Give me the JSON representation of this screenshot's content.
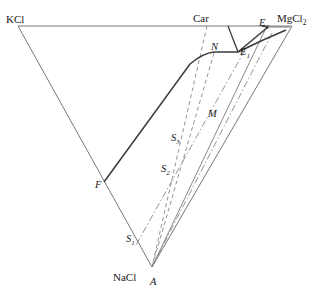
{
  "figure": {
    "kind": "ternary-phase-diagram",
    "background_color": "#ffffff",
    "line_color": "#555555",
    "bold_line_color": "#3a3a3a",
    "text_color": "#1a1a1a",
    "width": 319,
    "height": 296
  },
  "vertices": [
    {
      "id": "kcl",
      "label": "KCl",
      "sub": "",
      "x": 18,
      "y": 26,
      "label_x": 6,
      "label_y": 14
    },
    {
      "id": "mgcl2",
      "label": "MgCl",
      "sub": "2",
      "x": 292,
      "y": 26,
      "label_x": 277,
      "label_y": 13
    },
    {
      "id": "nacl",
      "label": "NaCl",
      "sub": "",
      "x": 152,
      "y": 267,
      "label_x": 113,
      "label_y": 272
    }
  ],
  "points": [
    {
      "id": "car",
      "label": "Car",
      "sub": "",
      "italic": false,
      "x": 207,
      "y": 25,
      "label_x": 193,
      "label_y": 13
    },
    {
      "id": "e2",
      "label": "E",
      "sub": "2",
      "italic": true,
      "x": 268,
      "y": 27,
      "label_x": 259,
      "label_y": 18
    },
    {
      "id": "e1",
      "label": "E",
      "sub": "1",
      "italic": true,
      "x": 238,
      "y": 52,
      "label_x": 240,
      "label_y": 47
    },
    {
      "id": "n",
      "label": "N",
      "sub": "",
      "italic": true,
      "x": 214,
      "y": 52,
      "label_x": 211,
      "label_y": 42
    },
    {
      "id": "m",
      "label": "M",
      "sub": "",
      "italic": true,
      "x": 204,
      "y": 114,
      "label_x": 208,
      "label_y": 109
    },
    {
      "id": "s3",
      "label": "S",
      "sub": "3",
      "italic": true,
      "x": 185,
      "y": 140,
      "label_x": 171,
      "label_y": 133
    },
    {
      "id": "s2",
      "label": "S",
      "sub": "2",
      "italic": true,
      "x": 175,
      "y": 172,
      "label_x": 161,
      "label_y": 164
    },
    {
      "id": "s1",
      "label": "S",
      "sub": "1",
      "italic": true,
      "x": 139,
      "y": 240,
      "label_x": 126,
      "label_y": 234
    },
    {
      "id": "f",
      "label": "F",
      "sub": "",
      "italic": true,
      "x": 104,
      "y": 182,
      "label_x": 95,
      "label_y": 180
    },
    {
      "id": "a",
      "label": "A",
      "sub": "",
      "italic": true,
      "x": 152,
      "y": 267,
      "label_x": 150,
      "label_y": 277
    }
  ],
  "edges": {
    "triangle_top": {
      "from": "kcl",
      "to": "mgcl2",
      "style": "solid-thin"
    },
    "triangle_left": {
      "from": "kcl",
      "to": "nacl",
      "style": "solid-thin"
    },
    "triangle_right": {
      "from": "mgcl2",
      "to": "nacl",
      "style": "solid-thin"
    }
  },
  "boundary_curves": [
    {
      "id": "f-n-e1",
      "desc": "solid boundary F to N to E1",
      "style": "solid-bold"
    },
    {
      "id": "e1-e2",
      "desc": "solid boundary E1 to E2",
      "style": "solid-bold"
    },
    {
      "id": "e2-top",
      "desc": "solid boundary E2 up to top edge",
      "style": "solid-bold"
    },
    {
      "id": "e1-mgcl2",
      "desc": "solid boundary E1 toward MgCl2 corner",
      "style": "solid-bold"
    }
  ],
  "dashed_lines": [
    {
      "id": "car-a",
      "desc": "dashed line Car to A",
      "style": "dashed"
    },
    {
      "id": "n-a",
      "desc": "dashed line N through M to A",
      "style": "dashed"
    }
  ],
  "dashdot_lines": [
    {
      "id": "e1-s1",
      "desc": "dash-dot from E1 through M to S1",
      "style": "dashdot"
    },
    {
      "id": "mgcl2-a",
      "desc": "dash-dot from MgCl2 region to A",
      "style": "dashdot"
    }
  ],
  "solid_rays": [
    {
      "id": "a-e2",
      "desc": "solid ray from A to E2 region",
      "style": "solid-thin"
    },
    {
      "id": "a-mgcl2",
      "desc": "solid ray from A to MgCl2",
      "style": "solid-thin"
    }
  ]
}
